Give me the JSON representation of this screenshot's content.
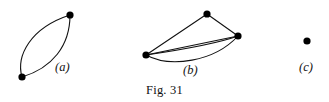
{
  "figure": {
    "caption": "Fig. 31",
    "stroke_color": "#111111",
    "vertex_color": "#000000",
    "background_color": "#ffffff"
  },
  "panels": [
    {
      "label": "(a)",
      "name": "graph-panel-a",
      "description": "Two vertices joined by a pair of curved parallel edges forming a lens",
      "vertex_count": 2,
      "edge_count": 2,
      "vertices": [
        {
          "name": "vertex-a-top",
          "x": 70,
          "y": 15,
          "r": 3.6
        },
        {
          "name": "vertex-a-bottom",
          "x": 22,
          "y": 77,
          "r": 3.6
        }
      ],
      "edges": [
        {
          "name": "edge-a-left",
          "path": "M 22 77 C 16 56 30 28 70 15"
        },
        {
          "name": "edge-a-right",
          "path": "M 22 77 C 52 68 70 46 70 15"
        }
      ]
    },
    {
      "label": "(b)",
      "name": "graph-panel-b",
      "description": "Three vertices; top vertex joined to left and right, and three parallel edges between left and right vertices",
      "vertex_count": 3,
      "edge_count": 5,
      "vertices": [
        {
          "name": "vertex-b-top",
          "x": 207,
          "y": 14,
          "r": 3.6
        },
        {
          "name": "vertex-b-right",
          "x": 238,
          "y": 36,
          "r": 3.6
        },
        {
          "name": "vertex-b-left",
          "x": 146,
          "y": 55,
          "r": 3.6
        }
      ],
      "edges": [
        {
          "name": "edge-b-left-top",
          "path": "M 146 55 L 207 14"
        },
        {
          "name": "edge-b-top-right",
          "path": "M 207 14 L 238 36"
        },
        {
          "name": "edge-b-left-right-upper",
          "path": "M 146 55 L 238 36"
        },
        {
          "name": "edge-b-left-right-middle",
          "path": "M 146 55 C 180 50 216 44 238 36"
        },
        {
          "name": "edge-b-left-right-lower",
          "path": "M 146 55 C 170 68 214 62 238 36"
        }
      ]
    },
    {
      "label": "(c)",
      "name": "graph-panel-c",
      "description": "A single isolated vertex with no edges",
      "vertex_count": 1,
      "edge_count": 0,
      "vertices": [
        {
          "name": "vertex-c-single",
          "x": 307,
          "y": 41,
          "r": 3.6
        }
      ],
      "edges": []
    }
  ]
}
